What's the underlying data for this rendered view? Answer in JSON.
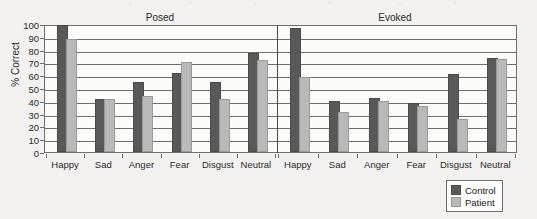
{
  "chart_data": {
    "type": "bar",
    "title": "",
    "xlabel": "",
    "ylabel": "% Correct",
    "ylim": [
      0,
      100
    ],
    "yticks": [
      0,
      10,
      20,
      30,
      40,
      50,
      60,
      70,
      80,
      90,
      100
    ],
    "grid": true,
    "legend_position": "bottom-right",
    "panels": [
      {
        "name": "Posed",
        "categories": [
          "Happy",
          "Sad",
          "Anger",
          "Fear",
          "Disgust",
          "Neutral"
        ],
        "series": [
          {
            "name": "Control",
            "values": [
              98,
              40,
              53,
              60,
              53,
              76
            ]
          },
          {
            "name": "Patient",
            "values": [
              87,
              40,
              42,
              69,
              40,
              70
            ]
          }
        ]
      },
      {
        "name": "Evoked",
        "categories": [
          "Happy",
          "Sad",
          "Anger",
          "Fear",
          "Disgust",
          "Neutral"
        ],
        "series": [
          {
            "name": "Control",
            "values": [
              95,
              38,
              41,
              37,
              59,
              72
            ]
          },
          {
            "name": "Patient",
            "values": [
              57,
              30,
              38,
              34,
              24,
              71
            ]
          }
        ]
      }
    ],
    "legend": [
      {
        "label": "Control",
        "color": "#595959"
      },
      {
        "label": "Patient",
        "color": "#b9b9b9"
      }
    ],
    "colors": {
      "control": "#595959",
      "patient": "#b9b9b9",
      "axis": "#6e6e6e",
      "background": "#f2f1ef"
    }
  }
}
